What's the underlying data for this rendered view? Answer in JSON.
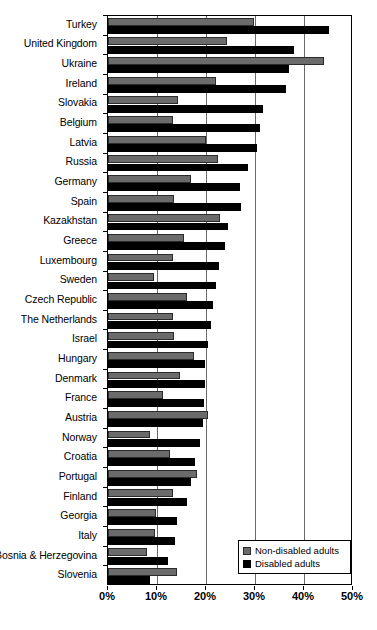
{
  "chart_data": {
    "type": "bar",
    "orientation": "horizontal",
    "title": "",
    "xlabel": "",
    "ylabel": "",
    "xlim": [
      0,
      50
    ],
    "xticks": [
      0,
      10,
      20,
      30,
      40,
      50
    ],
    "xtick_labels": [
      "0%",
      "10%",
      "20%",
      "30%",
      "40%",
      "50%"
    ],
    "grid": true,
    "grid_axis": "x",
    "legend_position": "bottom-right",
    "categories": [
      "Turkey",
      "United Kingdom",
      "Ukraine",
      "Ireland",
      "Slovakia",
      "Belgium",
      "Latvia",
      "Russia",
      "Germany",
      "Spain",
      "Kazakhstan",
      "Greece",
      "Luxembourg",
      "Sweden",
      "Czech Republic",
      "The Netherlands",
      "Israel",
      "Hungary",
      "Denmark",
      "France",
      "Austria",
      "Norway",
      "Croatia",
      "Portugal",
      "Finland",
      "Georgia",
      "Italy",
      "Bosnia & Herzegovina",
      "Slovenia"
    ],
    "series": [
      {
        "name": "Non-disabled adults",
        "color": "#6b6b6b",
        "values": [
          29.8,
          24.3,
          44.1,
          22.0,
          14.3,
          13.3,
          20.0,
          22.4,
          17.0,
          13.5,
          22.9,
          15.6,
          13.3,
          9.4,
          16.1,
          13.3,
          13.5,
          17.6,
          14.7,
          11.2,
          20.4,
          8.6,
          12.7,
          18.2,
          13.3,
          9.8,
          9.6,
          8.0,
          14.1
        ]
      },
      {
        "name": "Disabled adults",
        "color": "#000000",
        "values": [
          45.1,
          38.0,
          37.0,
          36.3,
          31.6,
          31.0,
          30.4,
          28.5,
          27.0,
          27.1,
          24.5,
          23.9,
          22.7,
          22.0,
          21.4,
          21.0,
          20.4,
          19.8,
          19.8,
          19.6,
          19.4,
          18.8,
          17.8,
          17.0,
          16.1,
          14.1,
          13.7,
          12.2,
          8.6
        ]
      }
    ]
  },
  "legend": {
    "items": [
      {
        "label": "Non-disabled adults",
        "swatch": "nondisabled"
      },
      {
        "label": "Disabled adults",
        "swatch": "disabled"
      }
    ]
  }
}
